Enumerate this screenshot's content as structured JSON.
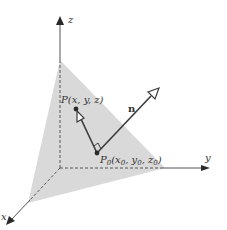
{
  "figure": {
    "axes": {
      "x_label": "x",
      "y_label": "y",
      "z_label": "z"
    },
    "points": {
      "P": {
        "name": "P",
        "coords": "(x, y, z)"
      },
      "P0": {
        "name": "P",
        "sub": "0",
        "coords_open": "(x",
        "c1sub": "0",
        "comma1": ", y",
        "c2sub": "0",
        "comma2": ", z",
        "c3sub": "0",
        "close": ")"
      }
    },
    "vector_label": "n",
    "colors": {
      "plane_fill": "#d9d9d9",
      "line": "#3a3a3a",
      "background": "#ffffff"
    }
  }
}
